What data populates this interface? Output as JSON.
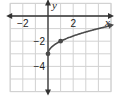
{
  "chart_data": {
    "type": "line",
    "title": "",
    "function": "y = sqrt(x) - 3",
    "xlabel": "x",
    "ylabel": "y",
    "xlim": [
      -3,
      5
    ],
    "ylim": [
      -6,
      1
    ],
    "x_tick_labels": [
      {
        "value": -2,
        "label": "−2"
      },
      {
        "value": 2,
        "label": "2"
      }
    ],
    "y_tick_labels": [
      {
        "value": -2,
        "label": "−2"
      },
      {
        "value": -4,
        "label": "−4"
      }
    ],
    "grid": true,
    "series": [
      {
        "name": "curve",
        "x": [
          0,
          0.25,
          0.5,
          1,
          1.5,
          2,
          2.5,
          3,
          3.5,
          4,
          4.5,
          5
        ],
        "y": [
          -3,
          -2.5,
          -2.29,
          -2,
          -1.78,
          -1.59,
          -1.42,
          -1.27,
          -1.13,
          -1,
          -0.88,
          -0.76
        ],
        "color": "#4a4a4a"
      }
    ],
    "points": [
      {
        "x": 0,
        "y": -3
      },
      {
        "x": 1,
        "y": -2
      }
    ]
  }
}
